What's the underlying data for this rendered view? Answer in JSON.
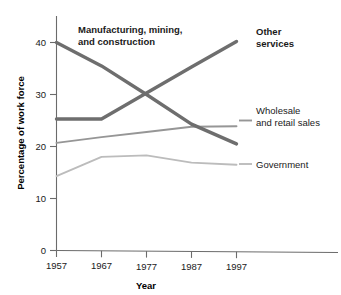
{
  "chart_data": {
    "type": "line",
    "title": "",
    "xlabel": "Year",
    "ylabel": "Percentage of work force",
    "x": [
      1957,
      1967,
      1977,
      1987,
      1997
    ],
    "xtick_labels": [
      "1957",
      "1967",
      "1977",
      "1987",
      "1997"
    ],
    "ytick_labels": [
      "0",
      "10",
      "20",
      "30",
      "40"
    ],
    "yticks": [
      0,
      10,
      20,
      30,
      40
    ],
    "xlim": [
      1957,
      1997
    ],
    "ylim": [
      0,
      43
    ],
    "grid": false,
    "legend": "inline-annotations",
    "series": [
      {
        "name": "Manufacturing, mining, and construction",
        "label": "Manufacturing, mining,\nand construction",
        "label_line1": "Manufacturing, mining,",
        "label_line2": "and construction",
        "emphasis": "bold",
        "color": "#6e6e6e",
        "width": 3.4,
        "values": [
          40.0,
          35.5,
          30.0,
          24.3,
          20.5
        ]
      },
      {
        "name": "Other services",
        "label": "Other services",
        "label_line1": "Other",
        "label_line2": "services",
        "emphasis": "bold",
        "color": "#6e6e6e",
        "width": 3.4,
        "values": [
          25.3,
          25.3,
          30.3,
          35.3,
          40.2
        ]
      },
      {
        "name": "Wholesale and retail sales",
        "label": "Wholesale and retail sales",
        "label_line1": "Wholesale",
        "label_line2": "and retail sales",
        "emphasis": "normal",
        "color": "#969696",
        "width": 1.9,
        "values": [
          20.7,
          21.8,
          22.8,
          23.8,
          23.9
        ]
      },
      {
        "name": "Government",
        "label": "Government",
        "label_line1": "Government",
        "label_line2": "",
        "emphasis": "normal",
        "color": "#bcbcbc",
        "width": 1.9,
        "values": [
          14.3,
          18.0,
          18.3,
          16.9,
          16.5
        ]
      }
    ]
  },
  "axes": {
    "x_title": "Year",
    "y_title": "Percentage of work force",
    "x_ticks": [
      "1957",
      "1967",
      "1977",
      "1987",
      "1997"
    ],
    "y_ticks": [
      "0",
      "10",
      "20",
      "30",
      "40"
    ]
  },
  "annotations": {
    "manufacturing_line1": "Manufacturing, mining,",
    "manufacturing_line2": "and construction",
    "other_services_line1": "Other",
    "other_services_line2": "services",
    "wholesale_line1": "Wholesale",
    "wholesale_line2": "and retail sales",
    "government_line1": "Government"
  },
  "colors": {
    "dark_series": "#6e6e6e",
    "mid_series": "#969696",
    "light_series": "#bcbcbc",
    "axis": "#6b6b6b",
    "text": "#1a1a1a",
    "background": "#ffffff"
  }
}
